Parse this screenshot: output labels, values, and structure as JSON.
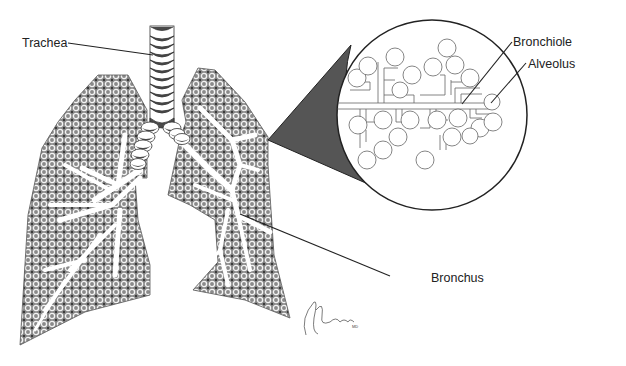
{
  "diagram": {
    "labels": {
      "trachea": "Trachea",
      "bronchiole": "Bronchiole",
      "alveolus": "Alveolus",
      "bronchus": "Bronchus"
    },
    "signature": "ABrader MD",
    "colors": {
      "background": "#ffffff",
      "lung_fill": "#8f8f8f",
      "pattern_ring": "#f2f2f2",
      "outline": "#222222",
      "cartilage_dark": "#4a4a4a",
      "magnifier_wedge": "#555555",
      "airway_white": "#ffffff"
    }
  }
}
